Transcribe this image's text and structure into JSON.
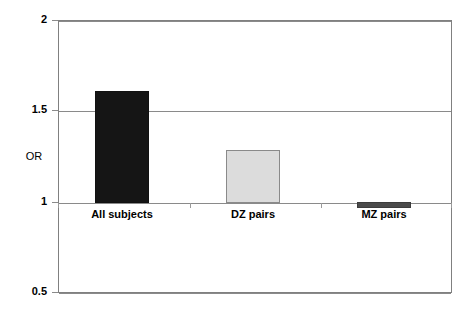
{
  "chart_data": {
    "type": "bar",
    "title": "",
    "subtitle": "",
    "xlabel": "",
    "ylabel": "OR",
    "categories": [
      "All subjects",
      "DZ pairs",
      "MZ pairs"
    ],
    "values": [
      1.6,
      1.29,
      0.97
    ],
    "baseline": 1,
    "ylim": [
      0.5,
      2
    ],
    "ytick_labels": [
      "2",
      "1.5",
      "1",
      "0.5"
    ],
    "ytick_values": [
      2,
      1.5,
      1,
      0.5
    ],
    "grid": true,
    "legend": "none",
    "series": [
      {
        "name": "OR",
        "values": [
          1.6,
          1.29,
          0.97
        ],
        "colors": [
          "#151515",
          "#dcdcdc",
          "#4a4a4a"
        ]
      }
    ],
    "bar_colors": {
      "all_subjects": "#151515",
      "dz_pairs": "#dcdcdc",
      "mz_pairs": "#4a4a4a"
    },
    "annotations": []
  },
  "axis": {
    "y_title": "OR",
    "ticks": [
      {
        "label": "2"
      },
      {
        "label": "1.5"
      },
      {
        "label": "1"
      },
      {
        "label": "0.5"
      }
    ]
  },
  "bars": [
    {
      "label": "All subjects",
      "value": 1.6
    },
    {
      "label": "DZ pairs",
      "value": 1.29
    },
    {
      "label": "MZ pairs",
      "value": 0.97
    }
  ]
}
